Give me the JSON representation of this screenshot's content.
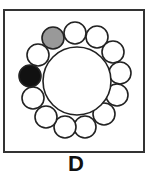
{
  "figure": {
    "label": "D",
    "center_circle": {
      "cx": 77,
      "cy": 81,
      "r": 34,
      "fill": "#ffffff"
    },
    "ring_circles": [
      {
        "cx": 53,
        "cy": 38,
        "fill": "#999999"
      },
      {
        "cx": 75,
        "cy": 33,
        "fill": "#ffffff"
      },
      {
        "cx": 97,
        "cy": 37,
        "fill": "#ffffff"
      },
      {
        "cx": 113,
        "cy": 52,
        "fill": "#ffffff"
      },
      {
        "cx": 120,
        "cy": 73,
        "fill": "#ffffff"
      },
      {
        "cx": 117,
        "cy": 95,
        "fill": "#ffffff"
      },
      {
        "cx": 104,
        "cy": 114,
        "fill": "#ffffff"
      },
      {
        "cx": 85,
        "cy": 127,
        "fill": "#ffffff"
      },
      {
        "cx": 65,
        "cy": 127,
        "fill": "#ffffff"
      },
      {
        "cx": 46,
        "cy": 117,
        "fill": "#ffffff"
      },
      {
        "cx": 33,
        "cy": 98,
        "fill": "#ffffff"
      },
      {
        "cx": 30,
        "cy": 76,
        "fill": "#111111"
      },
      {
        "cx": 38,
        "cy": 55,
        "fill": "#ffffff"
      }
    ],
    "ring_radius": 11,
    "stroke": "#222222"
  }
}
